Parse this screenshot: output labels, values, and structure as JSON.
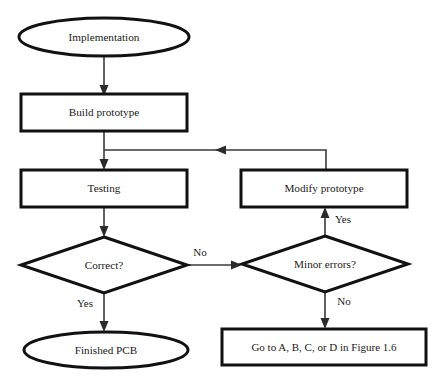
{
  "diagram": {
    "type": "flowchart",
    "background_color": "#ffffff",
    "stroke_color": "#111111",
    "connector_color": "#3a3a3a",
    "nodes": [
      {
        "id": "implementation",
        "shape": "ellipse",
        "label": "Implementation"
      },
      {
        "id": "build_prototype",
        "shape": "process",
        "label": "Build prototype"
      },
      {
        "id": "testing",
        "shape": "process",
        "label": "Testing"
      },
      {
        "id": "modify_prototype",
        "shape": "process",
        "label": "Modify prototype"
      },
      {
        "id": "correct",
        "shape": "decision",
        "label": "Correct?"
      },
      {
        "id": "minor_errors",
        "shape": "decision",
        "label": "Minor errors?"
      },
      {
        "id": "finished_pcb",
        "shape": "ellipse",
        "label": "Finished PCB"
      },
      {
        "id": "goto_figure",
        "shape": "process",
        "label": "Go to A, B, C, or D in Figure 1.6"
      }
    ],
    "edges": [
      {
        "id": "e-impl-build",
        "from": "implementation",
        "to": "build_prototype",
        "label": ""
      },
      {
        "id": "e-build-testing",
        "from": "build_prototype",
        "to": "testing",
        "label": ""
      },
      {
        "id": "e-testing-correct",
        "from": "testing",
        "to": "correct",
        "label": ""
      },
      {
        "id": "e-correct-no",
        "from": "correct",
        "to": "minor_errors",
        "label": "No"
      },
      {
        "id": "e-correct-yes",
        "from": "correct",
        "to": "finished_pcb",
        "label": "Yes"
      },
      {
        "id": "e-minor-yes",
        "from": "minor_errors",
        "to": "modify_prototype",
        "label": "Yes"
      },
      {
        "id": "e-minor-no",
        "from": "minor_errors",
        "to": "goto_figure",
        "label": "No"
      },
      {
        "id": "e-modify-loop",
        "from": "modify_prototype",
        "to": "testing",
        "label": ""
      }
    ],
    "edge_labels": {
      "correct_no": "No",
      "correct_yes": "Yes",
      "minor_yes": "Yes",
      "minor_no": "No"
    }
  }
}
